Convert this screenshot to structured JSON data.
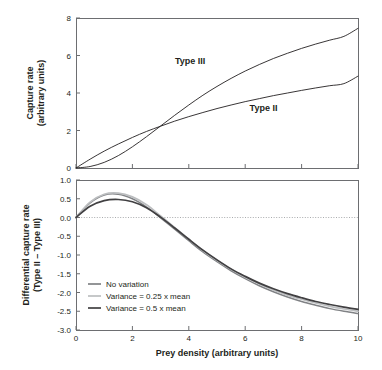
{
  "figure": {
    "background": "#ffffff",
    "frame_color": "#6d6e71",
    "text_color": "#231f20"
  },
  "chart_data": [
    {
      "id": "top-panel",
      "type": "line",
      "title": "",
      "xlabel": "",
      "ylabel": "Capture rate (arbitrary units)",
      "ylabel_lines": [
        "Capture rate",
        "(arbitrary units)"
      ],
      "xlim": [
        0,
        10
      ],
      "ylim": [
        0,
        8
      ],
      "xticks": [
        0,
        2,
        4,
        6,
        8,
        10
      ],
      "xticklabels": [
        "",
        "",
        "",
        "",
        "",
        ""
      ],
      "yticks": [
        0,
        2,
        4,
        6,
        8
      ],
      "yticklabels": [
        "0",
        "2",
        "4",
        "6",
        "8"
      ],
      "grid": false,
      "legend_position": "inline-annotations",
      "annotations": [
        {
          "text": "Type III",
          "x": 4.05,
          "y": 5.55
        },
        {
          "text": "Type II",
          "x": 6.65,
          "y": 3.05
        }
      ],
      "series": [
        {
          "name": "Type II",
          "color": "#231f20",
          "width": 0.9,
          "x": [
            0,
            0.5,
            1,
            1.5,
            2,
            2.5,
            3,
            3.5,
            4,
            4.5,
            5,
            5.5,
            6,
            6.5,
            7,
            7.5,
            8,
            8.5,
            9,
            9.5,
            10
          ],
          "y": [
            0,
            0.47,
            0.9,
            1.28,
            1.63,
            1.95,
            2.23,
            2.5,
            2.74,
            2.96,
            3.17,
            3.36,
            3.54,
            3.7,
            3.86,
            4.0,
            4.14,
            4.27,
            4.39,
            4.5,
            4.9
          ]
        },
        {
          "name": "Type III",
          "color": "#231f20",
          "width": 0.9,
          "x": [
            0,
            0.5,
            1,
            1.5,
            2,
            2.5,
            3,
            3.5,
            4,
            4.5,
            5,
            5.5,
            6,
            6.5,
            7,
            7.5,
            8,
            8.5,
            9,
            9.5,
            10
          ],
          "y": [
            0,
            0.08,
            0.3,
            0.66,
            1.13,
            1.67,
            2.24,
            2.81,
            3.36,
            3.88,
            4.35,
            4.78,
            5.17,
            5.52,
            5.84,
            6.12,
            6.38,
            6.61,
            6.82,
            7.02,
            7.45
          ]
        }
      ]
    },
    {
      "id": "bottom-panel",
      "type": "line",
      "title": "",
      "xlabel": "Prey density (arbitrary units)",
      "ylabel": "Differential capture rate (Type II – Type III)",
      "ylabel_lines": [
        "Differential capture rate",
        "(Type II – Type III)"
      ],
      "xlim": [
        0,
        10
      ],
      "ylim": [
        -3.0,
        1.0
      ],
      "xticks": [
        0,
        2,
        4,
        6,
        8,
        10
      ],
      "xticklabels": [
        "0",
        "2",
        "4",
        "6",
        "8",
        "10"
      ],
      "yticks": [
        1.0,
        0.5,
        0.0,
        -0.5,
        -1.0,
        -1.5,
        -2.0,
        -2.5,
        -3.0
      ],
      "yticklabels": [
        "1.0",
        "0.5",
        "0.0",
        "-0.5",
        "-1.0",
        "-1.5",
        "-2.0",
        "-2.5",
        "-3.0"
      ],
      "grid": false,
      "zero_reference_line": 0.0,
      "legend_position": "lower-left-inside",
      "series": [
        {
          "name": "No variation",
          "color": "#808285",
          "width": 1.5,
          "x": [
            0,
            0.5,
            1,
            1.5,
            2,
            2.5,
            3,
            3.5,
            4,
            4.5,
            5,
            5.5,
            6,
            6.5,
            7,
            7.5,
            8,
            8.5,
            9,
            9.5,
            10
          ],
          "y": [
            0,
            0.39,
            0.6,
            0.62,
            0.5,
            0.28,
            -0.01,
            -0.31,
            -0.62,
            -0.92,
            -1.18,
            -1.42,
            -1.63,
            -1.82,
            -1.98,
            -2.12,
            -2.24,
            -2.34,
            -2.43,
            -2.5,
            -2.56
          ]
        },
        {
          "name": "Variance = 0.25 x mean",
          "color": "#bcbec0",
          "width": 1.7,
          "x": [
            0,
            0.5,
            1,
            1.5,
            2,
            2.5,
            3,
            3.5,
            4,
            4.5,
            5,
            5.5,
            6,
            6.5,
            7,
            7.5,
            8,
            8.5,
            9,
            9.5,
            10
          ],
          "y": [
            0,
            0.41,
            0.62,
            0.65,
            0.55,
            0.34,
            0.04,
            -0.27,
            -0.58,
            -0.88,
            -1.14,
            -1.38,
            -1.59,
            -1.77,
            -1.93,
            -2.07,
            -2.18,
            -2.28,
            -2.37,
            -2.44,
            -2.5
          ]
        },
        {
          "name": "Variance = 0.5 x mean",
          "color": "#414042",
          "width": 1.7,
          "x": [
            0,
            0.5,
            1,
            1.5,
            2,
            2.5,
            3,
            3.5,
            4,
            4.5,
            5,
            5.5,
            6,
            6.5,
            7,
            7.5,
            8,
            8.5,
            9,
            9.5,
            10
          ],
          "y": [
            0,
            0.3,
            0.45,
            0.48,
            0.42,
            0.26,
            0.01,
            -0.28,
            -0.58,
            -0.87,
            -1.13,
            -1.37,
            -1.57,
            -1.75,
            -1.9,
            -2.03,
            -2.14,
            -2.24,
            -2.32,
            -2.39,
            -2.45
          ]
        }
      ],
      "legend": [
        {
          "label": "No variation",
          "color": "#808285"
        },
        {
          "label": "Variance = 0.25 x mean",
          "color": "#bcbec0"
        },
        {
          "label": "Variance = 0.5 x mean",
          "color": "#414042"
        }
      ]
    }
  ]
}
